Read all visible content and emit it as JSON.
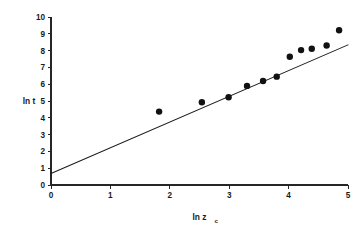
{
  "chart_data": {
    "type": "scatter",
    "title": "",
    "xlabel": "ln z_c",
    "xlabel_main": "ln z",
    "xlabel_subscript": "c",
    "ylabel": "ln t",
    "xlim": [
      0,
      5
    ],
    "ylim": [
      0,
      10
    ],
    "xticks": [
      "0",
      "1",
      "2",
      "3",
      "4",
      "5"
    ],
    "xtick_values": [
      0,
      1,
      2,
      3,
      4,
      5
    ],
    "yticks": [
      "0",
      "1",
      "2",
      "3",
      "4",
      "5",
      "6",
      "7",
      "8",
      "9",
      "10"
    ],
    "ytick_values": [
      0,
      1,
      2,
      3,
      4,
      5,
      6,
      7,
      8,
      9,
      10
    ],
    "grid": false,
    "legend": null,
    "marker": "filled-circle",
    "marker_color": "#111111",
    "line_color": "#1a1a1a",
    "points": [
      {
        "x": 1.82,
        "y": 4.37
      },
      {
        "x": 2.54,
        "y": 4.93
      },
      {
        "x": 2.99,
        "y": 5.22
      },
      {
        "x": 3.3,
        "y": 5.9
      },
      {
        "x": 3.57,
        "y": 6.19
      },
      {
        "x": 3.8,
        "y": 6.45
      },
      {
        "x": 4.02,
        "y": 7.63
      },
      {
        "x": 4.21,
        "y": 8.03
      },
      {
        "x": 4.39,
        "y": 8.11
      },
      {
        "x": 4.64,
        "y": 8.3
      },
      {
        "x": 4.85,
        "y": 9.21
      }
    ],
    "fit_line": {
      "x_start": 0.0,
      "y_start": 0.68,
      "x_end": 5.0,
      "y_end": 8.34,
      "slope": 1.53,
      "intercept": 0.68
    }
  },
  "geometry": {
    "plot_left": 51,
    "plot_right": 348,
    "plot_top": 17,
    "plot_bottom": 185
  }
}
